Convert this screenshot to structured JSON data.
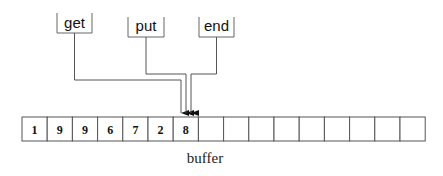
{
  "diagram": {
    "pointers": [
      {
        "label": "get"
      },
      {
        "label": "put"
      },
      {
        "label": "end"
      }
    ],
    "buffer": {
      "caption": "buffer",
      "cells": [
        "1",
        "9",
        "9",
        "6",
        "7",
        "2",
        "8",
        "",
        "",
        "",
        "",
        "",
        "",
        "",
        "",
        ""
      ]
    },
    "colors": {
      "line": "#555555",
      "text": "#111111",
      "background": "#ffffff"
    }
  }
}
